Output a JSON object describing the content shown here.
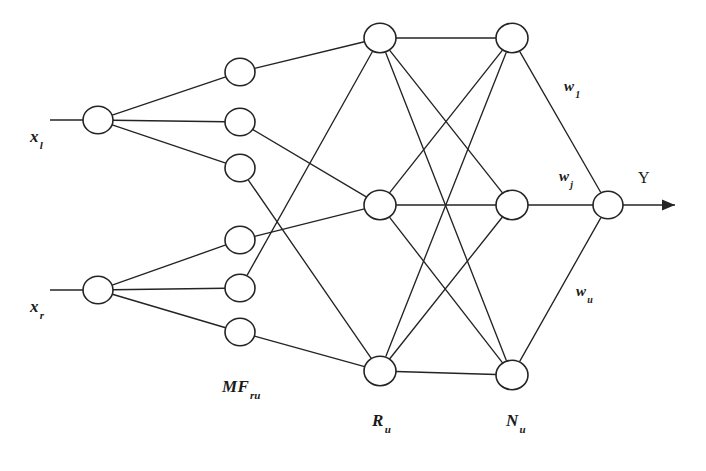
{
  "figure": {
    "type": "neural-network-diagram",
    "background_color": "#ffffff",
    "stroke_color": "#242424"
  },
  "labels": {
    "input_1": {
      "base": "x",
      "sub": "l",
      "x": 30,
      "y": 128
    },
    "input_2": {
      "base": "x",
      "sub": "r",
      "x": 30,
      "y": 298
    },
    "mf_layer": {
      "base": "MF",
      "sub": "ru",
      "x": 222,
      "y": 378
    },
    "rule_layer": {
      "base": "R",
      "sub": "u",
      "x": 372,
      "y": 412
    },
    "norm_layer": {
      "base": "N",
      "sub": "u",
      "x": 506,
      "y": 412
    },
    "weight_1": {
      "base": "w",
      "sub": "1",
      "x": 564,
      "y": 78
    },
    "weight_j": {
      "base": "w",
      "sub": "j",
      "x": 559,
      "y": 168
    },
    "weight_u": {
      "base": "w",
      "sub": "u",
      "x": 576,
      "y": 283
    },
    "output": {
      "base": "Y",
      "sub": "",
      "x": 638,
      "y": 170
    }
  },
  "layers": [
    {
      "name": "input",
      "label": "inputs",
      "node_radius": 15,
      "nodes": [
        {
          "id": "x1",
          "cx": 98,
          "cy": 120
        },
        {
          "id": "xr",
          "cx": 98,
          "cy": 290
        }
      ]
    },
    {
      "name": "membership",
      "label": "MF",
      "node_radius": 15,
      "nodes": [
        {
          "id": "mf1",
          "cx": 240,
          "cy": 72
        },
        {
          "id": "mf2",
          "cx": 240,
          "cy": 122
        },
        {
          "id": "mf3",
          "cx": 240,
          "cy": 168
        },
        {
          "id": "mf4",
          "cx": 240,
          "cy": 240
        },
        {
          "id": "mf5",
          "cx": 240,
          "cy": 288
        },
        {
          "id": "mf6",
          "cx": 240,
          "cy": 332
        }
      ]
    },
    {
      "name": "rule",
      "label": "R",
      "node_radius": 16,
      "nodes": [
        {
          "id": "r1",
          "cx": 380,
          "cy": 38
        },
        {
          "id": "r2",
          "cx": 380,
          "cy": 205
        },
        {
          "id": "r3",
          "cx": 380,
          "cy": 371
        }
      ]
    },
    {
      "name": "normalization",
      "label": "N",
      "node_radius": 16,
      "nodes": [
        {
          "id": "n1",
          "cx": 512,
          "cy": 38
        },
        {
          "id": "n2",
          "cx": 512,
          "cy": 205
        },
        {
          "id": "n3",
          "cx": 512,
          "cy": 375
        }
      ]
    },
    {
      "name": "output",
      "label": "Y",
      "node_radius": 15,
      "nodes": [
        {
          "id": "y",
          "cx": 608,
          "cy": 205
        }
      ]
    }
  ],
  "edges": {
    "input_to_mf": [
      [
        "x1",
        "mf1"
      ],
      [
        "x1",
        "mf2"
      ],
      [
        "x1",
        "mf3"
      ],
      [
        "xr",
        "mf4"
      ],
      [
        "xr",
        "mf5"
      ],
      [
        "xr",
        "mf6"
      ]
    ],
    "mf_to_rule": [
      [
        "mf1",
        "r1"
      ],
      [
        "mf2",
        "r2"
      ],
      [
        "mf3",
        "r3"
      ],
      [
        "mf4",
        "r2"
      ],
      [
        "mf5",
        "r1"
      ],
      [
        "mf6",
        "r3"
      ]
    ],
    "rule_to_norm": [
      [
        "r1",
        "n1"
      ],
      [
        "r1",
        "n2"
      ],
      [
        "r1",
        "n3"
      ],
      [
        "r2",
        "n1"
      ],
      [
        "r2",
        "n2"
      ],
      [
        "r2",
        "n3"
      ],
      [
        "r3",
        "n1"
      ],
      [
        "r3",
        "n2"
      ],
      [
        "r3",
        "n3"
      ]
    ],
    "norm_to_output": [
      [
        "n1",
        "y"
      ],
      [
        "n2",
        "y"
      ],
      [
        "n3",
        "y"
      ]
    ]
  },
  "leads": {
    "input_1_lead": {
      "x1": 50,
      "y1": 120,
      "x2": 83,
      "y2": 120
    },
    "input_2_lead": {
      "x1": 50,
      "y1": 290,
      "x2": 83,
      "y2": 290
    },
    "output_lead": {
      "x1": 623,
      "y1": 205,
      "x2": 675,
      "y2": 205
    }
  }
}
